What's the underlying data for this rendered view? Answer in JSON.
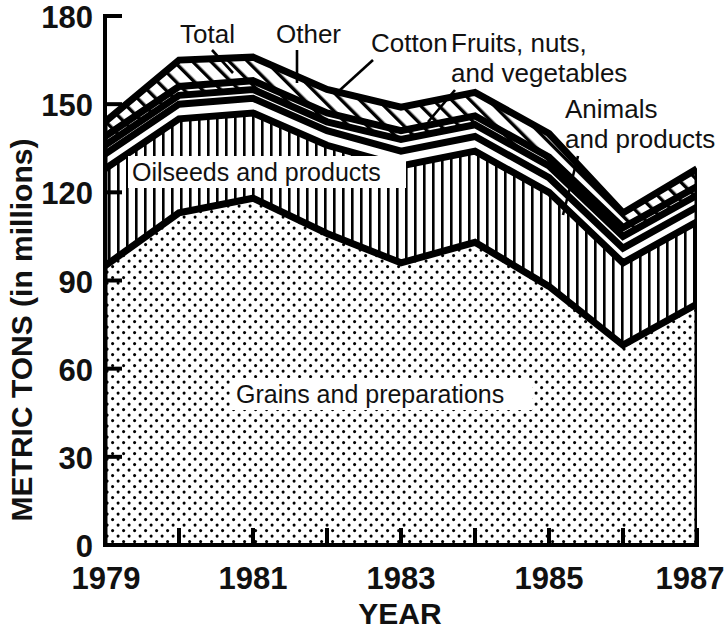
{
  "chart_data": {
    "type": "area",
    "title": "",
    "xlabel": "YEAR",
    "ylabel": "METRIC TONS (in millions)",
    "x": [
      1979,
      1980,
      1981,
      1982,
      1983,
      1984,
      1985,
      1986,
      1987
    ],
    "xlim": [
      1979,
      1987
    ],
    "ylim": [
      0,
      180
    ],
    "xticks": [
      1979,
      1980,
      1981,
      1982,
      1983,
      1984,
      1985,
      1986,
      1987
    ],
    "xtick_labels": [
      "1979",
      "",
      "1981",
      "",
      "1983",
      "",
      "1985",
      "",
      "1987"
    ],
    "yticks": [
      0,
      30,
      60,
      90,
      120,
      150,
      180
    ],
    "ytick_labels": [
      "0",
      "30",
      "60",
      "90",
      "120",
      "150",
      "180"
    ],
    "grid": false,
    "legend": "inline-annotations",
    "stacked": true,
    "series": [
      {
        "name": "Grains and preparations",
        "pattern": "dots",
        "values": [
          95,
          113,
          118,
          106,
          96,
          103,
          88,
          68,
          82
        ]
      },
      {
        "name": "Oilseeds and products",
        "pattern": "vertical-lines",
        "values": [
          33,
          32,
          29,
          30,
          33,
          31,
          32,
          28,
          28
        ]
      },
      {
        "name": "Animals and products",
        "pattern": "white",
        "values": [
          5,
          5,
          5,
          5,
          5,
          5,
          5,
          5,
          5
        ]
      },
      {
        "name": "Fruits, nuts, and vegetables",
        "pattern": "white",
        "values": [
          3,
          3,
          3,
          3,
          4,
          4,
          4,
          4,
          4
        ]
      },
      {
        "name": "Cotton",
        "pattern": "diagonal-lines",
        "values": [
          3,
          3,
          3,
          3,
          3,
          3,
          3,
          3,
          3
        ]
      },
      {
        "name": "Other",
        "pattern": "diagonal-lines",
        "values": [
          5,
          9,
          8,
          8,
          8,
          8,
          8,
          5,
          6
        ]
      }
    ],
    "totals": [
      139,
      164,
      163,
      152,
      148,
      151,
      137,
      112,
      132
    ],
    "series_labels_in_plot": [
      "Oilseeds and products",
      "Grains and preparations"
    ],
    "callouts": [
      "Total",
      "Other",
      "Cotton",
      "Fruits, nuts,",
      "and vegetables",
      "Animals",
      "and products"
    ]
  },
  "axes": {
    "y_title": "METRIC TONS (in millions)",
    "x_title": "YEAR"
  },
  "labels": {
    "oilseeds": "Oilseeds and products",
    "grains": "Grains and preparations",
    "total": "Total",
    "other": "Other",
    "cotton": "Cotton",
    "fruits_line1": "Fruits, nuts,",
    "fruits_line2": "and vegetables",
    "animals_line1": "Animals",
    "animals_line2": "and products"
  },
  "yticks": {
    "t180": "180",
    "t150": "150",
    "t120": "120",
    "t90": "90",
    "t60": "60",
    "t30": "30",
    "t0": "0"
  },
  "xticks": {
    "t1979": "1979",
    "t1981": "1981",
    "t1983": "1983",
    "t1985": "1985",
    "t1987": "1987"
  },
  "colors": {
    "ink": "#000000",
    "paper": "#ffffff"
  }
}
